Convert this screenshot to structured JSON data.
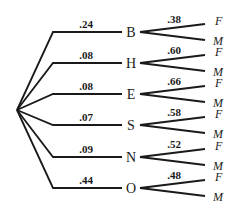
{
  "diagram": {
    "type": "probability-tree",
    "root": {
      "x": 17,
      "y": 110
    },
    "branches": [
      {
        "node": "B",
        "prob": ".24",
        "sub_prob": ".38",
        "leaves": [
          "F",
          "M"
        ],
        "y": 32
      },
      {
        "node": "H",
        "prob": ".08",
        "sub_prob": ".60",
        "leaves": [
          "F",
          "M"
        ],
        "y": 63
      },
      {
        "node": "E",
        "prob": ".08",
        "sub_prob": ".66",
        "leaves": [
          "F",
          "M"
        ],
        "y": 94
      },
      {
        "node": "S",
        "prob": ".07",
        "sub_prob": ".58",
        "leaves": [
          "F",
          "M"
        ],
        "y": 125
      },
      {
        "node": "N",
        "prob": ".09",
        "sub_prob": ".52",
        "leaves": [
          "F",
          "M"
        ],
        "y": 157
      },
      {
        "node": "O",
        "prob": ".44",
        "sub_prob": ".48",
        "leaves": [
          "F",
          "M"
        ],
        "y": 188
      }
    ]
  }
}
